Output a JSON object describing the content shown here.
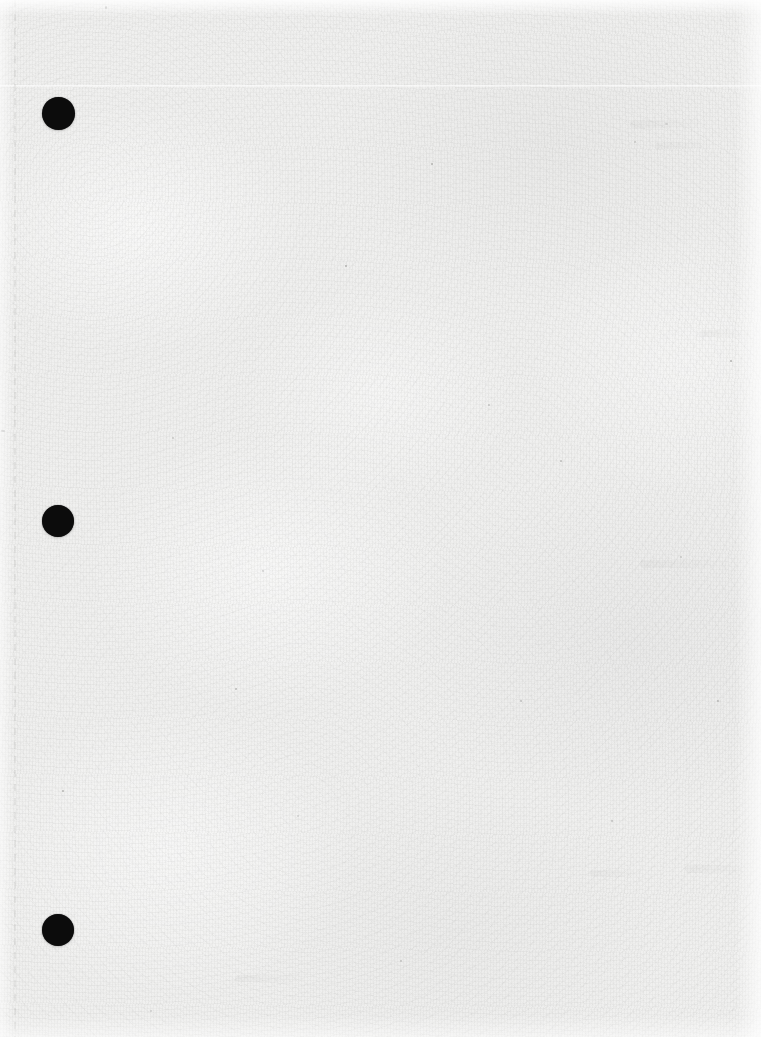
{
  "document": {
    "page_kind": "blank-scanned-page",
    "caption": "",
    "page_number": "",
    "visible_text": ""
  },
  "canvas": {
    "width": 761,
    "height": 1037
  },
  "colors": {
    "paper_base": "#f0f0ef",
    "paper_light": "#f7f7f6",
    "paper_shadow": "#e4e4e3",
    "punch_hole": "#0c0c0c",
    "speck": "#5a5a58",
    "rule": "#a0a09e"
  },
  "punch_holes": [
    {
      "name": "punch-hole-top",
      "cx": 58,
      "cy": 113,
      "d": 33
    },
    {
      "name": "punch-hole-middle",
      "cx": 58,
      "cy": 521,
      "d": 32
    },
    {
      "name": "punch-hole-bottom",
      "cx": 58,
      "cy": 930,
      "d": 32
    }
  ],
  "marks": {
    "crease_horizontal_y": 85,
    "rule_vertical_x": 14,
    "specks": [
      {
        "x": 665,
        "y": 123,
        "w": 3,
        "h": 2
      },
      {
        "x": 1,
        "y": 430,
        "w": 4,
        "h": 2
      },
      {
        "x": 431,
        "y": 163,
        "w": 2,
        "h": 2
      },
      {
        "x": 634,
        "y": 141,
        "w": 2,
        "h": 2
      },
      {
        "x": 105,
        "y": 6,
        "w": 2,
        "h": 3
      },
      {
        "x": 262,
        "y": 570,
        "w": 2,
        "h": 2
      },
      {
        "x": 488,
        "y": 404,
        "w": 2,
        "h": 2
      },
      {
        "x": 730,
        "y": 360,
        "w": 2,
        "h": 2
      },
      {
        "x": 172,
        "y": 437,
        "w": 2,
        "h": 2
      },
      {
        "x": 560,
        "y": 460,
        "w": 2,
        "h": 2
      },
      {
        "x": 297,
        "y": 815,
        "w": 2,
        "h": 2
      },
      {
        "x": 611,
        "y": 820,
        "w": 2,
        "h": 2
      },
      {
        "x": 62,
        "y": 790,
        "w": 2,
        "h": 2
      },
      {
        "x": 400,
        "y": 960,
        "w": 2,
        "h": 2
      },
      {
        "x": 717,
        "y": 700,
        "w": 2,
        "h": 2
      },
      {
        "x": 150,
        "y": 1010,
        "w": 2,
        "h": 2
      },
      {
        "x": 520,
        "y": 700,
        "w": 2,
        "h": 2
      },
      {
        "x": 345,
        "y": 265,
        "w": 2,
        "h": 2
      },
      {
        "x": 680,
        "y": 556,
        "w": 2,
        "h": 2
      },
      {
        "x": 235,
        "y": 688,
        "w": 2,
        "h": 2
      }
    ],
    "ghosts": [
      {
        "x": 630,
        "y": 120,
        "w": 70,
        "h": 8,
        "rot": -1
      },
      {
        "x": 655,
        "y": 142,
        "w": 55,
        "h": 7,
        "rot": -1
      },
      {
        "x": 700,
        "y": 330,
        "w": 48,
        "h": 7,
        "rot": 0
      },
      {
        "x": 640,
        "y": 560,
        "w": 90,
        "h": 8,
        "rot": 0
      },
      {
        "x": 685,
        "y": 865,
        "w": 60,
        "h": 8,
        "rot": 0
      },
      {
        "x": 590,
        "y": 870,
        "w": 50,
        "h": 7,
        "rot": 0
      },
      {
        "x": 235,
        "y": 975,
        "w": 70,
        "h": 7,
        "rot": 0
      }
    ]
  }
}
